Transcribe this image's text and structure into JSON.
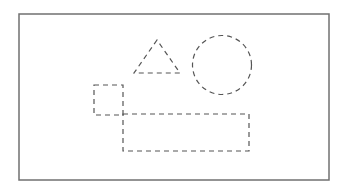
{
  "diagram": {
    "frame": {
      "x": 19,
      "y": 14,
      "width": 310,
      "height": 166,
      "stroke": "#6e6e6e"
    },
    "shapes": [
      {
        "kind": "triangle",
        "points": [
          [
            157,
            40
          ],
          [
            134,
            73
          ],
          [
            180,
            73
          ]
        ],
        "style": "dashed"
      },
      {
        "kind": "circle",
        "cx": 222,
        "cy": 65,
        "r": 29.5,
        "style": "dashed"
      },
      {
        "kind": "square",
        "x": 94,
        "y": 85,
        "width": 29,
        "height": 30,
        "style": "dashed"
      },
      {
        "kind": "rectangle",
        "x": 123,
        "y": 114,
        "width": 126,
        "height": 37,
        "style": "dashed"
      }
    ],
    "dash_color": "#555555"
  }
}
